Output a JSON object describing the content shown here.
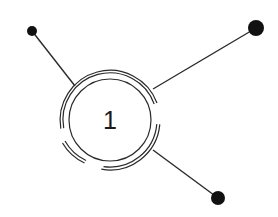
{
  "diagram": {
    "type": "hub-and-spoke",
    "colors": {
      "background": "#ffffff",
      "stroke": "#2a2a2a",
      "dot": "#111111",
      "text": "#1a1a1a"
    },
    "hub": {
      "label": "1",
      "cx": 110,
      "cy": 120,
      "inner_radius": 41,
      "outer_rings": [
        47,
        50
      ]
    },
    "spokes": [
      {
        "name": "top-left",
        "from": [
          75,
          86
        ],
        "to": [
          32,
          31
        ],
        "dot_radius": 5
      },
      {
        "name": "top-right",
        "from": [
          153,
          89
        ],
        "to": [
          256,
          28
        ],
        "dot_radius": 8
      },
      {
        "name": "bottom-right",
        "from": [
          153,
          150
        ],
        "to": [
          218,
          198
        ],
        "dot_radius": 7
      }
    ]
  }
}
